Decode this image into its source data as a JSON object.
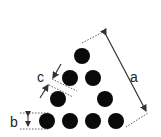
{
  "diagram": {
    "labels": {
      "a": "a",
      "b": "b",
      "c": "c"
    },
    "circle_color": "#0a0a0a",
    "line_color": "#333333",
    "circle_radius": 8,
    "circles": [
      {
        "row": 1,
        "cx": 82,
        "cy": 56
      },
      {
        "row": 2,
        "cx": 70,
        "cy": 78
      },
      {
        "row": 2,
        "cx": 93,
        "cy": 78
      },
      {
        "row": 3,
        "cx": 58,
        "cy": 99
      },
      {
        "row": 3,
        "cx": 105,
        "cy": 99
      },
      {
        "row": 4,
        "cx": 47,
        "cy": 121
      },
      {
        "row": 4,
        "cx": 70,
        "cy": 121
      },
      {
        "row": 4,
        "cx": 93,
        "cy": 121
      },
      {
        "row": 4,
        "cx": 116,
        "cy": 121
      }
    ]
  }
}
